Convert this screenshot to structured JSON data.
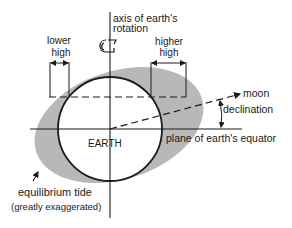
{
  "labels": {
    "axis_line1": "axis of earth's",
    "axis_line2": "rotation",
    "lower_high_line1": "lower",
    "lower_high_line2": "high",
    "higher_high_line1": "higher",
    "higher_high_line2": "high",
    "moon": "moon",
    "declination": "declination",
    "equator": "plane of earth's equator",
    "earth": "EARTH",
    "tide_line1": "equilibrium tide",
    "tide_line2": "(greatly exaggerated)"
  },
  "colors": {
    "tide_fill": "#b8b8b8",
    "line": "#1a1a1a",
    "earth_fill": "#ffffff"
  }
}
